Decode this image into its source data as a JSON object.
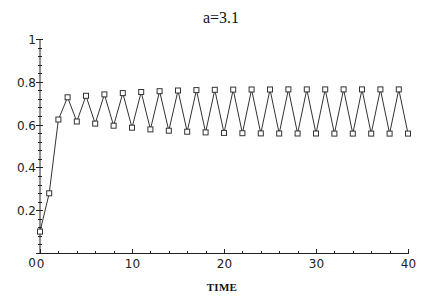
{
  "chart_data": {
    "type": "line",
    "title": "a=3.1",
    "xlabel": "TIME",
    "ylabel": "",
    "xlim": [
      0,
      40
    ],
    "ylim": [
      0,
      1
    ],
    "grid": false,
    "legend": null,
    "x_ticks": [
      0,
      10,
      20,
      30,
      40
    ],
    "x_tick_labels": [
      "0",
      "10",
      "20",
      "30",
      "40"
    ],
    "x_minor_step": 2,
    "y_ticks": [
      0,
      0.2,
      0.4,
      0.6,
      0.8,
      1
    ],
    "y_tick_labels": [
      "0",
      "0.2",
      "0.4",
      "0.6",
      "0.8",
      "1"
    ],
    "y_minor_step": 0.04,
    "marker": "open-square",
    "series": [
      {
        "name": "x(t)",
        "x": [
          0,
          1,
          2,
          3,
          4,
          5,
          6,
          7,
          8,
          9,
          10,
          11,
          12,
          13,
          14,
          15,
          16,
          17,
          18,
          19,
          20,
          21,
          22,
          23,
          24,
          25,
          26,
          27,
          28,
          29,
          30,
          31,
          32,
          33,
          34,
          35,
          36,
          37,
          38,
          39,
          40
        ],
        "values": [
          0.1,
          0.279,
          0.6237,
          0.7276,
          0.6144,
          0.7344,
          0.6047,
          0.7411,
          0.5948,
          0.7471,
          0.5857,
          0.7522,
          0.5778,
          0.7562,
          0.5715,
          0.7592,
          0.5667,
          0.7612,
          0.5634,
          0.7625,
          0.5612,
          0.7634,
          0.5598,
          0.7639,
          0.5591,
          0.7642,
          0.5586,
          0.7644,
          0.5583,
          0.7645,
          0.5582,
          0.7645,
          0.5581,
          0.7646,
          0.558,
          0.7646,
          0.558,
          0.7646,
          0.558,
          0.7646,
          0.558
        ]
      }
    ]
  },
  "layout": {
    "plot_left": 40,
    "plot_right": 408,
    "plot_top": 39,
    "plot_bottom": 253
  }
}
